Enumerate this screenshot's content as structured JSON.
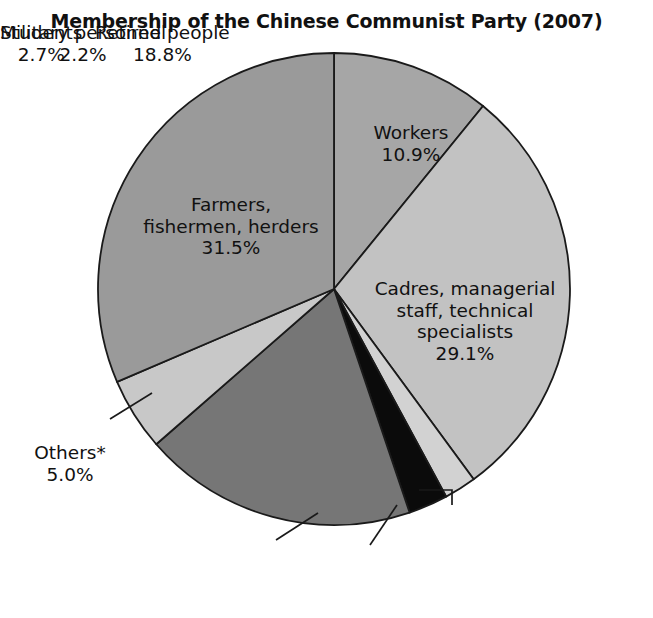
{
  "chart_data": {
    "type": "pie",
    "title": "Membership of the Chinese Communist Party (2007)",
    "unit": "%",
    "legend_position": "none",
    "start_angle_deg": 0,
    "direction": "clockwise",
    "categories": [
      "Workers",
      "Cadres, managerial staff, technical specialists",
      "Military personnel",
      "Students",
      "Retired people",
      "Others*",
      "Farmers, fishermen, herders"
    ],
    "values": [
      10.9,
      29.1,
      2.2,
      2.7,
      18.8,
      5.0,
      31.5
    ],
    "slices": [
      {
        "key": "workers",
        "label": "Workers",
        "value": 10.9,
        "value_text": "10.9%",
        "color": "#a6a6a6",
        "label_placement": "inside"
      },
      {
        "key": "cadres",
        "label": "Cadres, managerial\nstaff, technical\nspecialists",
        "value": 29.1,
        "value_text": "29.1%",
        "color": "#c2c2c2",
        "label_placement": "inside"
      },
      {
        "key": "military",
        "label": "Military personnel",
        "value": 2.2,
        "value_text": "2.2%",
        "color": "#d2d2d2",
        "label_placement": "outside-leader"
      },
      {
        "key": "students",
        "label": "Students",
        "value": 2.7,
        "value_text": "2.7%",
        "color": "#0b0b0b",
        "label_placement": "outside-leader"
      },
      {
        "key": "retired",
        "label": "Retired people",
        "value": 18.8,
        "value_text": "18.8%",
        "color": "#767676",
        "label_placement": "outside-leader"
      },
      {
        "key": "others",
        "label": "Others*",
        "value": 5.0,
        "value_text": "5.0%",
        "color": "#c8c8c8",
        "label_placement": "outside-leader"
      },
      {
        "key": "farmers",
        "label": "Farmers,\nfishermen, herders",
        "value": 31.5,
        "value_text": "31.5%",
        "color": "#9a9a9a",
        "label_placement": "inside"
      }
    ],
    "stroke_color": "#1a1a1a",
    "background": "#ffffff"
  }
}
